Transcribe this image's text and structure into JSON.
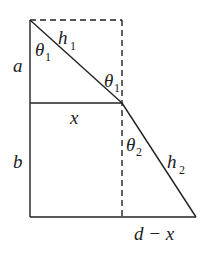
{
  "diagram": {
    "type": "geometry-refraction",
    "stroke_color": "#222222",
    "labels": {
      "a": "a",
      "b": "b",
      "x": "x",
      "d_minus_x": "d − x",
      "h1": "h",
      "h1_sub": "1",
      "h2": "h",
      "h2_sub": "2",
      "theta1_top": "θ",
      "theta1_top_sub": "1",
      "theta1_mid": "θ",
      "theta1_mid_sub": "1",
      "theta2": "θ",
      "theta2_sub": "2"
    }
  }
}
